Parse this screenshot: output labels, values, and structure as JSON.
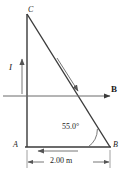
{
  "figure": {
    "background_color": "#ffffff",
    "line_color": "#3a3a3a",
    "text_color": "#1a1a1a",
    "width": 129,
    "height": 174
  },
  "labels": {
    "vertex_top": "C",
    "vertex_bottom_left": "A",
    "vertex_bottom_right": "B",
    "current": "I",
    "field": "B",
    "angle": "55.0°",
    "dimension": "2.00 m"
  },
  "geometry": {
    "vertex_C": {
      "x": 27,
      "y": 14
    },
    "vertex_A": {
      "x": 27,
      "y": 147
    },
    "vertex_B": {
      "x": 110,
      "y": 147
    },
    "angle_at_B_degrees": 55.0,
    "base_length": "2.00 m",
    "field_line_y": 96,
    "field_line_x_start": 3,
    "field_line_x_end": 112,
    "current_arrow_x": 22,
    "current_arrow_y_start": 92,
    "current_arrow_y_end": 58,
    "dimension_line_y": 162
  },
  "icons": {
    "current_arrow": "arrow-up-icon",
    "field_arrow": "arrow-right-icon",
    "hypotenuse_arrow": "arrow-down-right-icon",
    "base_arrow": "arrow-left-icon",
    "angle_arc": "angle-arc-icon",
    "dimension_arrows": "dimension-double-arrow-icon"
  }
}
